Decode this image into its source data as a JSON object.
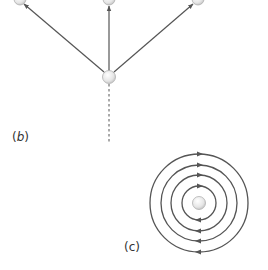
{
  "diagram": {
    "panel_b": {
      "label_open": "(",
      "label_letter": "b",
      "label_close": ")",
      "nodes": [
        {
          "id": "top-left",
          "x": 20,
          "y": -1
        },
        {
          "id": "top-center",
          "x": 109,
          "y": -1
        },
        {
          "id": "top-right",
          "x": 198,
          "y": -1
        },
        {
          "id": "center",
          "x": 109,
          "y": 77
        }
      ],
      "edges": [
        {
          "from": "center",
          "to": "top-left",
          "type": "double-arrow"
        },
        {
          "from": "center",
          "to": "top-center",
          "type": "double-arrow"
        },
        {
          "from": "center",
          "to": "top-right",
          "type": "double-arrow"
        },
        {
          "from": "center",
          "to": "below",
          "type": "dashed"
        }
      ]
    },
    "panel_c": {
      "label_open": "(",
      "label_letter": "c",
      "label_close": ")",
      "center": {
        "x": 199,
        "y": 203
      },
      "radii": [
        17,
        28,
        38,
        49
      ],
      "arrow_direction": "clockwise"
    },
    "colors": {
      "line": "#555555",
      "node_fill": "#eeeeee",
      "node_stroke": "#aaaaaa",
      "text": "#333333"
    }
  }
}
